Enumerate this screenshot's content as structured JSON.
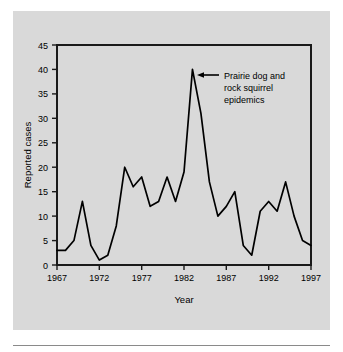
{
  "figure": {
    "panel_color": "#d9d9d9",
    "page_color": "#ffffff",
    "line_color": "#000000",
    "frame_color": "#1a1a1a"
  },
  "annotation": {
    "line1": "Prairie dog and",
    "line2": "rock squirrel",
    "line3": "epidemics",
    "arrow": "left-arrow",
    "target_year": 1983,
    "target_value": 40
  },
  "chart_data": {
    "type": "line",
    "title": "",
    "xlabel": "Year",
    "ylabel": "Reported cases",
    "xlim": [
      1967,
      1997
    ],
    "ylim": [
      0,
      45
    ],
    "grid": false,
    "legend": "none",
    "xticks": [
      1967,
      1972,
      1977,
      1982,
      1987,
      1992,
      1997
    ],
    "xtick_labels": [
      "1967",
      "1972",
      "1977",
      "1982",
      "1987",
      "1992",
      "1997"
    ],
    "yticks": [
      0,
      5,
      10,
      15,
      20,
      25,
      30,
      35,
      40,
      45
    ],
    "ytick_labels": [
      "0",
      "5",
      "10",
      "15",
      "20",
      "25",
      "30",
      "35",
      "40",
      "45"
    ],
    "series": [
      {
        "name": "Reported plague cases",
        "x": [
          1967,
          1968,
          1969,
          1970,
          1971,
          1972,
          1973,
          1974,
          1975,
          1976,
          1977,
          1978,
          1979,
          1980,
          1981,
          1982,
          1983,
          1984,
          1985,
          1986,
          1987,
          1988,
          1989,
          1990,
          1991,
          1992,
          1993,
          1994,
          1995,
          1996,
          1997
        ],
        "values": [
          3,
          3,
          5,
          13,
          4,
          1,
          2,
          8,
          20,
          16,
          18,
          12,
          13,
          18,
          13,
          19,
          40,
          31,
          17,
          10,
          12,
          15,
          4,
          2,
          11,
          13,
          11,
          17,
          10,
          5,
          4
        ]
      }
    ]
  }
}
